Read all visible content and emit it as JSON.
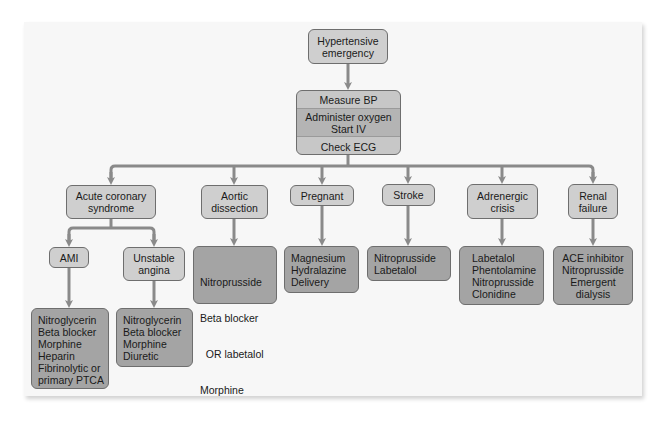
{
  "diagram": {
    "root": {
      "lines": [
        "Hypertensive",
        "emergency"
      ]
    },
    "initial_steps": {
      "rows": [
        {
          "lines": [
            "Measure BP"
          ]
        },
        {
          "lines": [
            "Administer oxygen",
            "Start IV"
          ]
        },
        {
          "lines": [
            "Check ECG"
          ]
        }
      ]
    },
    "branches": [
      {
        "condition": {
          "lines": [
            "Acute coronary",
            "syndrome"
          ]
        },
        "subbranches": [
          {
            "condition": {
              "lines": [
                "AMI"
              ]
            },
            "treatment": {
              "lines": [
                "Nitroglycerin",
                "Beta blocker",
                "Morphine",
                "Heparin",
                "Fibrinolytic or",
                "primary PTCA"
              ]
            }
          },
          {
            "condition": {
              "lines": [
                "Unstable",
                "angina"
              ]
            },
            "treatment": {
              "lines": [
                "Nitroglycerin",
                "Beta blocker",
                "Morphine",
                "Diuretic"
              ]
            }
          }
        ]
      },
      {
        "condition": {
          "lines": [
            "Aortic",
            "dissection"
          ]
        },
        "treatment": {
          "lines": [
            "Nitroprusside",
            "Beta blocker",
            "  OR labetalol",
            "Morphine"
          ]
        }
      },
      {
        "condition": {
          "lines": [
            "Pregnant"
          ]
        },
        "treatment": {
          "lines": [
            "Magnesium",
            "Hydralazine",
            "Delivery"
          ]
        }
      },
      {
        "condition": {
          "lines": [
            "Stroke"
          ]
        },
        "treatment": {
          "lines": [
            "Nitroprusside",
            "Labetalol"
          ]
        }
      },
      {
        "condition": {
          "lines": [
            "Adrenergic",
            "crisis"
          ]
        },
        "treatment": {
          "lines": [
            "Labetalol",
            "Phentolamine",
            "Nitroprusside",
            "Clonidine"
          ]
        }
      },
      {
        "condition": {
          "lines": [
            "Renal",
            "failure"
          ]
        },
        "treatment": {
          "lines": [
            "ACE inhibitor",
            "Nitroprusside",
            "Emergent",
            "dialysis"
          ]
        }
      }
    ]
  },
  "colors": {
    "panel_bg": "#f7f7f7",
    "condition_box": "#cfcfcf",
    "treatment_box": "#a4a4a4",
    "connector": "#8a8a8a",
    "border": "#6e6e6e"
  }
}
